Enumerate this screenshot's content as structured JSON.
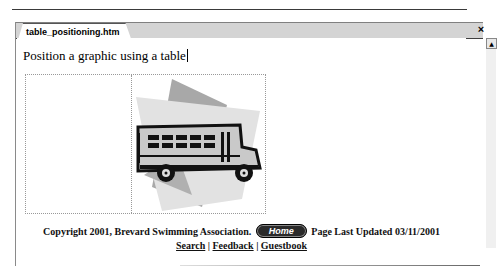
{
  "document_tab": {
    "filename": "table_positioning.htm"
  },
  "window_controls": {
    "close_glyph": "×",
    "scroll_up_glyph": "▲"
  },
  "page": {
    "heading": "Position a graphic using a table",
    "image": {
      "description": "school bus clipart",
      "icon": "school-bus-icon",
      "colors": {
        "bus_body": "#c8c8c8",
        "outline": "#111111",
        "shape_light": "#e4e4e4",
        "shape_dark": "#a8a8a8"
      }
    },
    "footer": {
      "copyright": "Copyright 2001, Brevard Swimming Association.",
      "home_button": "Home",
      "last_updated": "Page Last Updated 03/11/2001",
      "links": [
        {
          "label": "Search"
        },
        {
          "label": "Feedback"
        },
        {
          "label": "Guestbook"
        }
      ],
      "separator": "|"
    }
  }
}
